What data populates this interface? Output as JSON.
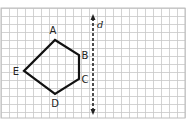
{
  "figure": {
    "grid": {
      "x0": 1,
      "y0": 8,
      "x1": 185,
      "y1": 118,
      "cell": 8,
      "color": "#c8c8c8",
      "border": "#bdbdbd"
    },
    "line_of_reflection": {
      "label": "d",
      "x": 93,
      "y_top": 14,
      "y_bottom": 115,
      "style": "dashed"
    },
    "polygon": {
      "vertices": [
        {
          "name": "A",
          "x": 55,
          "y": 40,
          "label_x": 53,
          "label_y": 34
        },
        {
          "name": "B",
          "x": 79,
          "y": 55,
          "label_x": 85,
          "label_y": 59
        },
        {
          "name": "C",
          "x": 79,
          "y": 79,
          "label_x": 85,
          "label_y": 83
        },
        {
          "name": "D",
          "x": 55,
          "y": 94,
          "label_x": 55,
          "label_y": 107
        },
        {
          "name": "E",
          "x": 24,
          "y": 71,
          "label_x": 16,
          "label_y": 75
        }
      ],
      "stroke": "#111111"
    }
  }
}
